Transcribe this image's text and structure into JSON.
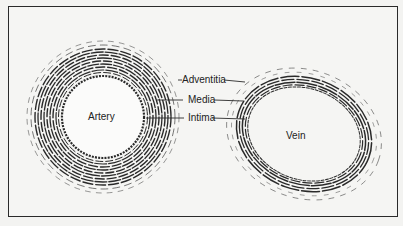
{
  "diagram": {
    "structures": [
      {
        "name": "Artery",
        "label": "Artery"
      },
      {
        "name": "Vein",
        "label": "Vein"
      }
    ],
    "layers": [
      {
        "label": "Adventitia"
      },
      {
        "label": "Media"
      },
      {
        "label": "Intima"
      }
    ],
    "colors": {
      "ink": "#2a2a2a",
      "paper": "#f5f5f3"
    }
  }
}
